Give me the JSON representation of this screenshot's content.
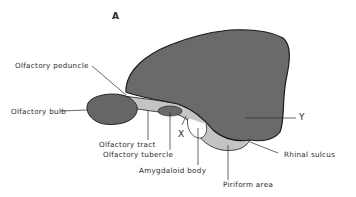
{
  "figure": {
    "panel_label": "A",
    "colors": {
      "cortex_fill": "#6a6a6a",
      "bulb_fill": "#666666",
      "tract_fill": "#c4c4c4",
      "outline": "#1a1a1a",
      "text": "#2a2a2a",
      "background": "#ffffff"
    },
    "labels": {
      "olfactory_peduncle": "Olfactory peduncle",
      "olfactory_bulb": "Olfactory bulb",
      "olfactory_tract": "Olfactory tract",
      "olfactory_tubercle": "Olfactory tubercle",
      "amygdaloid_body": "Amygdaloid body",
      "piriform_area": "Piriform area",
      "rhinal_sulcus": "Rhinal sulcus",
      "marker_x": "X",
      "marker_y": "Y"
    }
  }
}
